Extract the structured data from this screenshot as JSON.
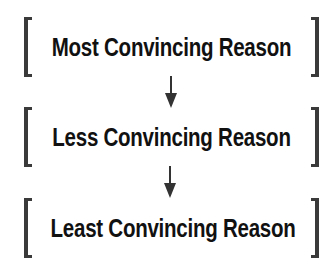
{
  "diagram": {
    "type": "vertical-hierarchy",
    "levels": [
      {
        "label": "Most Convincing Reason"
      },
      {
        "label": "Less Convincing Reason"
      },
      {
        "label": "Least Convincing Reason"
      }
    ],
    "connectors": [
      "arrow-down",
      "arrow-down"
    ],
    "colors": {
      "text": "#111111",
      "bracket": "#3a3a3a",
      "arrow": "#333333",
      "background": "#ffffff"
    }
  }
}
